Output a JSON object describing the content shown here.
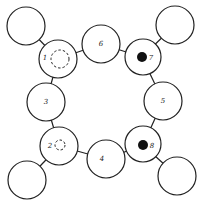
{
  "diagram": {
    "type": "ring-network",
    "colors": {
      "stroke": "#222222",
      "fill": "#ffffff",
      "filled_dot": "#111111"
    },
    "nodes": [
      {
        "id": "1",
        "label": "1",
        "cx": 58,
        "cy": 59,
        "r": 19,
        "marker": "dashed-circle",
        "mx": 60,
        "my": 59,
        "mr": 9,
        "lx": 45,
        "ly": 58
      },
      {
        "id": "6",
        "label": "6",
        "cx": 101,
        "cy": 44,
        "r": 19,
        "marker": "none",
        "lx": 101,
        "ly": 44
      },
      {
        "id": "7",
        "label": "7",
        "cx": 143,
        "cy": 57,
        "r": 18,
        "marker": "filled-dot",
        "mx": 142,
        "my": 57,
        "mr": 5,
        "lx": 151,
        "ly": 58
      },
      {
        "id": "3",
        "label": "3",
        "cx": 46,
        "cy": 102,
        "r": 19,
        "marker": "none",
        "lx": 46,
        "ly": 102
      },
      {
        "id": "5",
        "label": "5",
        "cx": 163,
        "cy": 101,
        "r": 19,
        "marker": "none",
        "lx": 163,
        "ly": 101
      },
      {
        "id": "2",
        "label": "2",
        "cx": 59,
        "cy": 146,
        "r": 19,
        "marker": "dashed-circle",
        "mx": 60,
        "my": 145,
        "mr": 5,
        "lx": 50,
        "ly": 146
      },
      {
        "id": "4",
        "label": "4",
        "cx": 106,
        "cy": 159,
        "r": 19,
        "marker": "none",
        "lx": 102,
        "ly": 159
      },
      {
        "id": "8",
        "label": "8",
        "cx": 143,
        "cy": 144,
        "r": 18,
        "marker": "filled-dot",
        "mx": 143,
        "my": 145,
        "mr": 5,
        "lx": 152,
        "ly": 146
      },
      {
        "id": "o1",
        "label": "",
        "cx": 26,
        "cy": 26,
        "r": 19,
        "marker": "none"
      },
      {
        "id": "o7",
        "label": "",
        "cx": 175,
        "cy": 25,
        "r": 19,
        "marker": "none"
      },
      {
        "id": "o2",
        "label": "",
        "cx": 27,
        "cy": 180,
        "r": 19,
        "marker": "none"
      },
      {
        "id": "o8",
        "label": "",
        "cx": 177,
        "cy": 176,
        "r": 19,
        "marker": "none"
      }
    ],
    "edges": [
      {
        "from": "1",
        "to": "6"
      },
      {
        "from": "6",
        "to": "7"
      },
      {
        "from": "7",
        "to": "5"
      },
      {
        "from": "5",
        "to": "8"
      },
      {
        "from": "8",
        "to": "4"
      },
      {
        "from": "4",
        "to": "2"
      },
      {
        "from": "2",
        "to": "3"
      },
      {
        "from": "3",
        "to": "1"
      },
      {
        "from": "1",
        "to": "o1"
      },
      {
        "from": "7",
        "to": "o7"
      },
      {
        "from": "2",
        "to": "o2"
      },
      {
        "from": "8",
        "to": "o8"
      }
    ]
  }
}
